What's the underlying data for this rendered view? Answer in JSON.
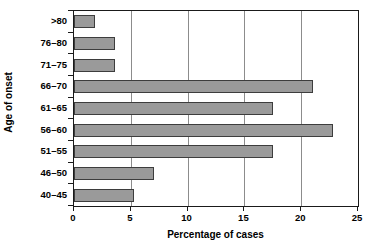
{
  "chart_data": {
    "type": "bar",
    "orientation": "horizontal",
    "title": "",
    "xlabel": "Percentage of cases",
    "ylabel": "Age of onset",
    "categories": [
      "40–45",
      "46–50",
      "51–55",
      "56–60",
      "61–65",
      "66–70",
      "71–75",
      "76–80",
      ">80"
    ],
    "values": [
      5.3,
      7.0,
      17.5,
      22.8,
      17.5,
      21.0,
      3.6,
      3.6,
      1.85
    ],
    "xlim": [
      0,
      25
    ],
    "xticks": [
      0,
      5,
      10,
      15,
      20,
      25
    ],
    "xtick_labels": [
      "0",
      "5",
      "10",
      "15",
      "20",
      "25"
    ],
    "grid": "vertical",
    "legend": "none",
    "bar_color": "#9a9a9a",
    "bar_edge_color": "#3d3d3d",
    "grid_color": "#8c8c8c",
    "frame_color": "#1a1a1a",
    "background": "#ffffff"
  }
}
